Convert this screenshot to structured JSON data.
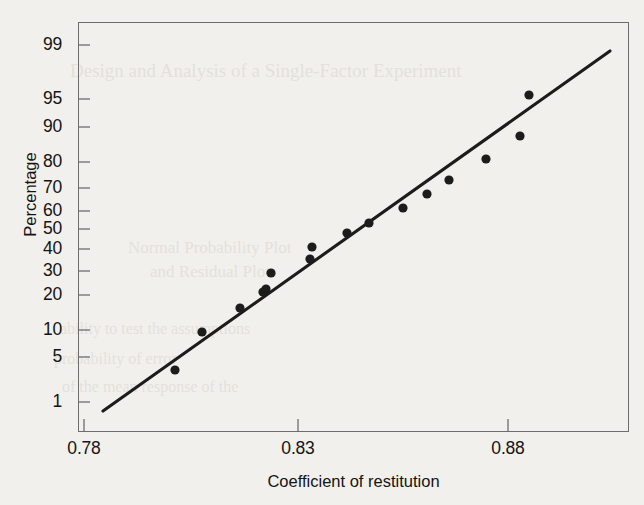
{
  "figure": {
    "background_color": "#f2f0ec",
    "frame_color": "#6d6d6d",
    "marker_color": "#1c1c1c",
    "line_color": "#1c1c1c"
  },
  "axes": {
    "y_label": "Percentage",
    "x_label": "Coefficient of restitution",
    "y_ticks": [
      {
        "label": "99",
        "value": 99,
        "y_px": 45
      },
      {
        "label": "95",
        "value": 95,
        "y_px": 99
      },
      {
        "label": "90",
        "value": 90,
        "y_px": 127
      },
      {
        "label": "80",
        "value": 80,
        "y_px": 162
      },
      {
        "label": "70",
        "value": 70,
        "y_px": 188
      },
      {
        "label": "60",
        "value": 60,
        "y_px": 211
      },
      {
        "label": "50",
        "value": 50,
        "y_px": 229
      },
      {
        "label": "40",
        "value": 40,
        "y_px": 249
      },
      {
        "label": "30",
        "value": 30,
        "y_px": 271
      },
      {
        "label": "20",
        "value": 20,
        "y_px": 295
      },
      {
        "label": "10",
        "value": 10,
        "y_px": 330
      },
      {
        "label": "5",
        "value": 5,
        "y_px": 357
      },
      {
        "label": "1",
        "value": 1,
        "y_px": 402
      }
    ],
    "x_ticks": [
      {
        "label": "0.78",
        "value": 0.78,
        "x_px": 84
      },
      {
        "label": "0.83",
        "value": 0.83,
        "x_px": 298
      },
      {
        "label": "0.88",
        "value": 0.88,
        "x_px": 508
      }
    ]
  },
  "chart_data": {
    "type": "scatter",
    "title": "",
    "xlabel": "Coefficient of restitution",
    "ylabel": "Percentage",
    "xlim": [
      0.7787,
      0.8917
    ],
    "ylim": [
      0.5,
      99.7
    ],
    "y_scale": "normal-probability",
    "grid": false,
    "legend": null,
    "categories": null,
    "points": [
      {
        "x": 0.7995,
        "y": 4.1,
        "px": 175,
        "py": 370
      },
      {
        "x": 0.8059,
        "y": 9.8,
        "px": 202,
        "py": 332
      },
      {
        "x": 0.8149,
        "y": 16.7,
        "px": 240,
        "py": 308
      },
      {
        "x": 0.8203,
        "y": 22.0,
        "px": 263,
        "py": 292
      },
      {
        "x": 0.821,
        "y": 22.7,
        "px": 266,
        "py": 289
      },
      {
        "x": 0.8222,
        "y": 28.4,
        "px": 271,
        "py": 273
      },
      {
        "x": 0.8314,
        "y": 34.8,
        "px": 310,
        "py": 259
      },
      {
        "x": 0.8319,
        "y": 41.5,
        "px": 312,
        "py": 247
      },
      {
        "x": 0.8402,
        "y": 48.3,
        "px": 347,
        "py": 233
      },
      {
        "x": 0.8454,
        "y": 54.5,
        "px": 369,
        "py": 223
      },
      {
        "x": 0.8532,
        "y": 61.0,
        "px": 403,
        "py": 208
      },
      {
        "x": 0.8589,
        "y": 67.6,
        "px": 427,
        "py": 194
      },
      {
        "x": 0.8641,
        "y": 73.8,
        "px": 449,
        "py": 180
      },
      {
        "x": 0.8728,
        "y": 81.2,
        "px": 486,
        "py": 159
      },
      {
        "x": 0.8809,
        "y": 88.4,
        "px": 520,
        "py": 136
      },
      {
        "x": 0.883,
        "y": 95.2,
        "px": 529,
        "py": 95
      }
    ],
    "fit_line": {
      "label": "normal reference line",
      "start": {
        "x": 0.7825,
        "y": 1.1,
        "px": 103,
        "py": 411
      },
      "end": {
        "x": 0.9021,
        "y": 98.6,
        "px": 610,
        "py": 51
      }
    },
    "marker_radius_px": 4.6,
    "n_points": 16
  },
  "ghost_text": {
    "lines": [
      {
        "text": "Design and Analysis of a Single-Factor Experiment",
        "x": 70,
        "y": 60,
        "size": 19
      },
      {
        "text": "Normal Probability Plot",
        "x": 128,
        "y": 238,
        "size": 17
      },
      {
        "text": "and Residual Plots",
        "x": 150,
        "y": 262,
        "size": 17
      },
      {
        "text": "ability to test the assumptions",
        "x": 60,
        "y": 320,
        "size": 16
      },
      {
        "text": "probability of error",
        "x": 54,
        "y": 350,
        "size": 16
      },
      {
        "text": "of the mean response of the",
        "x": 62,
        "y": 378,
        "size": 16
      }
    ]
  }
}
